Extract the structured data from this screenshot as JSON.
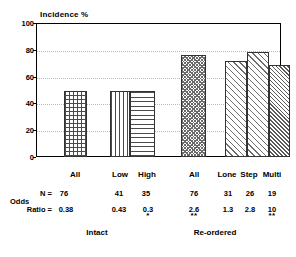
{
  "chart_data": {
    "type": "bar",
    "title": "",
    "ylabel": "Incidence %",
    "xlabel": "",
    "ylim": [
      0,
      100
    ],
    "yticks": [
      0,
      20,
      40,
      60,
      80,
      100
    ],
    "grid": true,
    "legend": false,
    "categories": [
      "All",
      "Low",
      "High",
      "All",
      "Lone",
      "Step",
      "Multi"
    ],
    "values": [
      49,
      49,
      49,
      76,
      72,
      78,
      69
    ],
    "patterns": [
      "cross-hatch",
      "vertical-lines",
      "horizontal-lines",
      "dotted",
      "diagonal-lines",
      "diagonal-lines",
      "dense-diagonal-lines"
    ],
    "groups": [
      {
        "label": "Intact",
        "categories": [
          "All",
          "Low",
          "High"
        ]
      },
      {
        "label": "Re-ordered",
        "categories": [
          "All",
          "Lone",
          "Step",
          "Multi"
        ]
      }
    ],
    "annotations": {
      "n_row_label": "N =",
      "odds_row_label_line1": "Odds",
      "odds_row_label_line2": "Ratio =",
      "n_values": [
        "76",
        "41",
        "35",
        "76",
        "31",
        "26",
        "19"
      ],
      "odds_ratios": [
        "0.38",
        "0.43",
        "0.3",
        "2.6",
        "1.3",
        "2.8",
        "10"
      ],
      "significance": [
        "",
        "",
        "*",
        "**",
        "",
        "",
        "**"
      ]
    }
  },
  "axis": {
    "y_title": "Incidence %",
    "ticks": [
      "100",
      "80",
      "60",
      "40",
      "20",
      "0"
    ]
  },
  "bars": [
    {
      "label": "All",
      "value": 49,
      "n": "76",
      "odds": "0.38",
      "sig": ""
    },
    {
      "label": "Low",
      "value": 49,
      "n": "41",
      "odds": "0.43",
      "sig": ""
    },
    {
      "label": "High",
      "value": 49,
      "n": "35",
      "odds": "0.3",
      "sig": "*"
    },
    {
      "label": "All",
      "value": 76,
      "n": "76",
      "odds": "2.6",
      "sig": "**"
    },
    {
      "label": "Lone",
      "value": 72,
      "n": "31",
      "odds": "1.3",
      "sig": ""
    },
    {
      "label": "Step",
      "value": 78,
      "n": "26",
      "odds": "2.8",
      "sig": ""
    },
    {
      "label": "Multi",
      "value": 69,
      "n": "19",
      "odds": "10",
      "sig": "**"
    }
  ],
  "table": {
    "n_label": "N =",
    "odds_label_top": "Odds",
    "odds_label_bottom": "Ratio ="
  },
  "groups": [
    {
      "label": "Intact"
    },
    {
      "label": "Re-ordered"
    }
  ],
  "style": {
    "axis_color": "#000000",
    "grid_color": "#b9b9b9",
    "bar_outline": "#333333",
    "background": "#ffffff"
  }
}
